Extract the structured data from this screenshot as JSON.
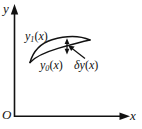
{
  "figure": {
    "background_color": "#ffffff",
    "stroke_color": "#111111",
    "axes": {
      "y_axis_label": "y",
      "x_axis_label": "x",
      "origin_label": "O",
      "y_axis_name": "vertical-axis",
      "x_axis_name": "horizontal-axis"
    },
    "labels": {
      "upper_curve": {
        "base": "y",
        "sub": "1",
        "arg": "(x)"
      },
      "lower_curve": {
        "base": "y",
        "sub": "0",
        "arg": "(x)"
      },
      "variation": {
        "base": "δy",
        "sub": "",
        "arg": "(x)"
      }
    },
    "curves": [
      {
        "name": "upper-curve-y1",
        "label": "y1(x)",
        "points": [
          [
            30,
            62
          ],
          [
            38,
            48
          ],
          [
            52,
            40
          ],
          [
            70,
            37
          ],
          [
            90,
            40
          ]
        ]
      },
      {
        "name": "lower-curve-y0",
        "label": "y0(x)",
        "points": [
          [
            30,
            62
          ],
          [
            42,
            54
          ],
          [
            58,
            48
          ],
          [
            74,
            43
          ],
          [
            90,
            40
          ]
        ]
      }
    ],
    "variation_marker": {
      "name": "variation-double-arrow",
      "x": 67,
      "y_top": 41,
      "y_bottom": 52
    },
    "pointer_arrow": {
      "name": "variation-leader-arrow",
      "from": [
        84,
        58
      ],
      "to": [
        69,
        47
      ]
    }
  }
}
